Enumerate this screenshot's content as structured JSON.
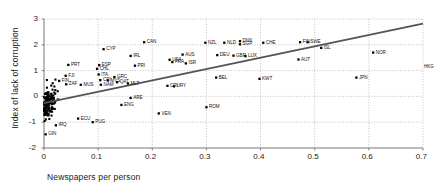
{
  "chart_data": {
    "type": "scatter",
    "title": "",
    "xlabel": "Newspapers per person",
    "ylabel": "Index of lack of corruption",
    "xlim": [
      0,
      0.7
    ],
    "ylim": [
      -2,
      3
    ],
    "xticks": [
      "0",
      "0.1",
      "0.2",
      "0.3",
      "0.4",
      "0.5",
      "0.6",
      "0.7"
    ],
    "xtick_values": [
      0,
      0.1,
      0.2,
      0.3,
      0.4,
      0.5,
      0.6,
      0.7
    ],
    "yticks": [
      "-2",
      "-1",
      "0",
      "1",
      "2",
      "3"
    ],
    "ytick_values": [
      -2,
      -1,
      0,
      1,
      2,
      3
    ],
    "grid": true,
    "legend": "none",
    "marker_style": "filled-square",
    "marker_color": "#000000",
    "trendline": {
      "type": "linear-fit",
      "color": "#555555",
      "x_start": 0.0,
      "y_start": -0.26,
      "x_end": 0.7,
      "y_end": 2.82
    },
    "labeled_points": [
      {
        "label": "GIN",
        "x": 0.003,
        "y": -1.47
      },
      {
        "label": "IRQ",
        "x": 0.022,
        "y": -1.12
      },
      {
        "label": "PRT",
        "x": 0.045,
        "y": 1.22
      },
      {
        "label": "FJI",
        "x": 0.04,
        "y": 0.8
      },
      {
        "label": "FIN2",
        "x": 0.028,
        "y": 0.6
      },
      {
        "label": "ZAF",
        "x": 0.041,
        "y": 0.47
      },
      {
        "label": "MUS",
        "x": 0.068,
        "y": 0.45
      },
      {
        "label": "ECU",
        "x": 0.063,
        "y": -0.86
      },
      {
        "label": "PUG",
        "x": 0.09,
        "y": -1.0
      },
      {
        "label": "CYP",
        "x": 0.11,
        "y": 1.83
      },
      {
        "label": "ESP",
        "x": 0.102,
        "y": 1.21
      },
      {
        "label": "CHL",
        "x": 0.098,
        "y": 1.07
      },
      {
        "label": "ITA",
        "x": 0.101,
        "y": 0.85
      },
      {
        "label": "CRI",
        "x": 0.104,
        "y": 0.63
      },
      {
        "label": "MYS",
        "x": 0.118,
        "y": 0.62
      },
      {
        "label": "NAM",
        "x": 0.105,
        "y": 0.45
      },
      {
        "label": "GRC",
        "x": 0.13,
        "y": 0.75
      },
      {
        "label": "QAT",
        "x": 0.135,
        "y": 0.55
      },
      {
        "label": "MLT",
        "x": 0.155,
        "y": 0.5
      },
      {
        "label": "ENG",
        "x": 0.143,
        "y": -0.33
      },
      {
        "label": "ARE",
        "x": 0.16,
        "y": -0.06
      },
      {
        "label": "IRL",
        "x": 0.16,
        "y": 1.57
      },
      {
        "label": "PRI",
        "x": 0.168,
        "y": 1.19
      },
      {
        "label": "CAN",
        "x": 0.185,
        "y": 2.1
      },
      {
        "label": "VEN",
        "x": 0.212,
        "y": -0.66
      },
      {
        "label": "USA",
        "x": 0.232,
        "y": 1.42
      },
      {
        "label": "FRA",
        "x": 0.237,
        "y": 1.33
      },
      {
        "label": "CRI2",
        "x": 0.228,
        "y": 0.41
      },
      {
        "label": "URY",
        "x": 0.24,
        "y": 0.39
      },
      {
        "label": "AUS",
        "x": 0.256,
        "y": 1.62
      },
      {
        "label": "ISR",
        "x": 0.262,
        "y": 1.28
      },
      {
        "label": "NZL",
        "x": 0.298,
        "y": 2.08
      },
      {
        "label": "ROM",
        "x": 0.3,
        "y": -0.42
      },
      {
        "label": "BEL",
        "x": 0.318,
        "y": 0.73
      },
      {
        "label": "DEU",
        "x": 0.32,
        "y": 1.6
      },
      {
        "label": "NLD",
        "x": 0.333,
        "y": 2.08
      },
      {
        "label": "GBR",
        "x": 0.35,
        "y": 1.58
      },
      {
        "label": "DNK",
        "x": 0.362,
        "y": 2.14
      },
      {
        "label": "SGP",
        "x": 0.362,
        "y": 2.02
      },
      {
        "label": "LUX",
        "x": 0.372,
        "y": 1.56
      },
      {
        "label": "KWT",
        "x": 0.398,
        "y": 0.68
      },
      {
        "label": "CHE",
        "x": 0.405,
        "y": 2.08
      },
      {
        "label": "AUT",
        "x": 0.47,
        "y": 1.43
      },
      {
        "label": "FIN",
        "x": 0.473,
        "y": 2.1
      },
      {
        "label": "SWE",
        "x": 0.487,
        "y": 2.1
      },
      {
        "label": "ISL",
        "x": 0.512,
        "y": 1.88
      },
      {
        "label": "JPN",
        "x": 0.577,
        "y": 0.73
      },
      {
        "label": "NOR",
        "x": 0.608,
        "y": 1.7
      },
      {
        "label": "HKG",
        "x": 0.7,
        "y": 1.16
      }
    ],
    "cluster_note": "dense unlabeled cloud of points between x=0 and x=0.1, y=-1.5 to 1.0",
    "n_points_approx": 150
  },
  "axes": {
    "x_title": "Newspapers per person",
    "y_title": "Index of lack of corruption"
  }
}
